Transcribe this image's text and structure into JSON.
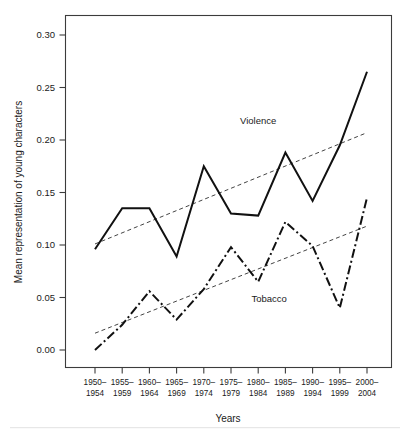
{
  "chart_data": {
    "type": "line",
    "title": "",
    "xlabel": "Years",
    "ylabel": "Mean representation of young characters",
    "categories": [
      "1950–\n1954",
      "1955–\n1959",
      "1960–\n1964",
      "1965–\n1969",
      "1970–\n1974",
      "1975–\n1979",
      "1980–\n1984",
      "1985–\n1989",
      "1990–\n1994",
      "1995–\n1999",
      "2000–\n2004"
    ],
    "categories_top": [
      "1950–",
      "1955–",
      "1960–",
      "1965–",
      "1970–",
      "1975–",
      "1980–",
      "1985–",
      "1990–",
      "1995–",
      "2000–"
    ],
    "categories_bottom": [
      "1954",
      "1959",
      "1964",
      "1969",
      "1974",
      "1979",
      "1984",
      "1989",
      "1994",
      "1999",
      "2004"
    ],
    "ylim": [
      0.0,
      0.315
    ],
    "yticks": [
      0.0,
      0.05,
      0.1,
      0.15,
      0.2,
      0.25,
      0.3
    ],
    "ytick_labels": [
      "0.00",
      "0.05",
      "0.10",
      "0.15",
      "0.20",
      "0.25",
      "0.30"
    ],
    "grid": false,
    "legend_position": "inline-annotations",
    "series": [
      {
        "name": "Violence",
        "style": "solid",
        "color": "#111111",
        "label_text": "Violence",
        "values": [
          0.096,
          0.135,
          0.135,
          0.089,
          0.175,
          0.13,
          0.128,
          0.188,
          0.142,
          0.195,
          0.265
        ],
        "trend_start": 0.101,
        "trend_end": 0.207
      },
      {
        "name": "Tobacco",
        "style": "dash-dot",
        "color": "#111111",
        "label_text": "Tobacco",
        "values": [
          0.0,
          0.024,
          0.056,
          0.029,
          0.058,
          0.098,
          0.065,
          0.122,
          0.099,
          0.04,
          0.145
        ],
        "trend_start": 0.016,
        "trend_end": 0.118
      }
    ],
    "annotations": [
      {
        "text": "Violence",
        "x_index": 6.0,
        "y": 0.215
      },
      {
        "text": "Tobacco",
        "x_index": 6.4,
        "y": 0.046
      }
    ]
  }
}
